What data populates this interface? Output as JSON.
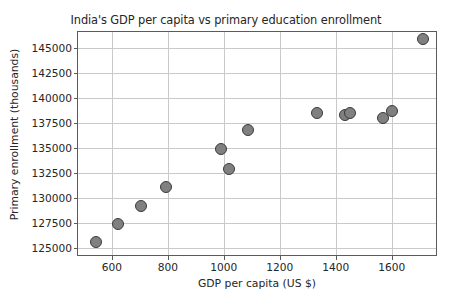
{
  "chart_data": {
    "type": "scatter",
    "title": "India's GDP per capita vs primary education enrollment",
    "xlabel": "GDP per capita (US $)",
    "ylabel": "Primary enrollment (thousands)",
    "xlim": [
      479,
      1765
    ],
    "ylim": [
      124100,
      146600
    ],
    "xticks": [
      600,
      800,
      1000,
      1200,
      1400,
      1600
    ],
    "xticklabels": [
      "600",
      "800",
      "1000",
      "1200",
      "1400",
      "1600"
    ],
    "yticks": [
      125000,
      127500,
      130000,
      132500,
      135000,
      137500,
      140000,
      142500,
      145000
    ],
    "yticklabels": [
      "125000",
      "127500",
      "130000",
      "132500",
      "135000",
      "137500",
      "140000",
      "142500",
      "145000"
    ],
    "grid": true,
    "legend": null,
    "marker_color": "#808080",
    "marker_edge_color": "#3a3a3a",
    "points": [
      {
        "x": 543,
        "y": 125600
      },
      {
        "x": 622,
        "y": 127400
      },
      {
        "x": 704,
        "y": 129200
      },
      {
        "x": 793,
        "y": 131100
      },
      {
        "x": 989,
        "y": 134900
      },
      {
        "x": 1018,
        "y": 132900
      },
      {
        "x": 1086,
        "y": 136800
      },
      {
        "x": 1332,
        "y": 138500
      },
      {
        "x": 1432,
        "y": 138300
      },
      {
        "x": 1449,
        "y": 138500
      },
      {
        "x": 1568,
        "y": 138000
      },
      {
        "x": 1600,
        "y": 138700
      },
      {
        "x": 1711,
        "y": 145900
      }
    ]
  }
}
